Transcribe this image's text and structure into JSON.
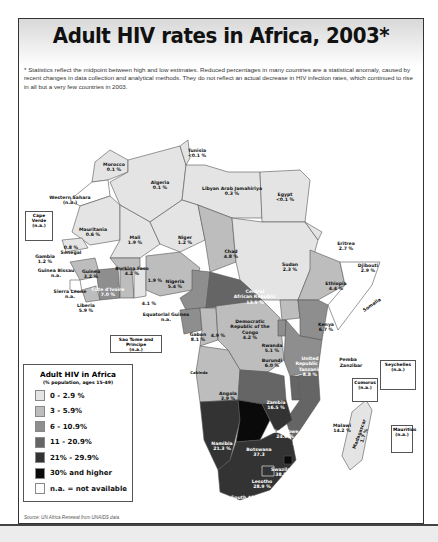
{
  "title": "Adult HIV rates in Africa, 2003*",
  "note": "* Statistics reflect the midpoint between high and low estimates. Reduced percentages in many countries are a statistical anomaly, caused by recent changes in data collection and analytical methods. They do not reflect an actual decrease in HIV infection rates, which continued to rise in all but a very few countries in 2003.",
  "legend": {
    "title": "Adult HIV in Africa",
    "subtitle": "(% population, ages 15-49)",
    "items": [
      {
        "label": "0 - 2.9 %",
        "color": "#e4e4e4"
      },
      {
        "label": "3 - 5.9%",
        "color": "#bdbdbd"
      },
      {
        "label": "6 - 10.9%",
        "color": "#8e8e8e"
      },
      {
        "label": "11 - 20.9%",
        "color": "#656565"
      },
      {
        "label": "21% - 29.9%",
        "color": "#333333"
      },
      {
        "label": "30% and higher",
        "color": "#0a0a0a"
      },
      {
        "label": "n.a. = not available",
        "color": "#ffffff"
      }
    ]
  },
  "source": "Source: UN Africa Renewal from UNAIDS data.",
  "countries": [
    {
      "name": "Tunisia",
      "value": "<0.1 %"
    },
    {
      "name": "Morocco",
      "value": "0.1 %"
    },
    {
      "name": "Algeria",
      "value": "0.1 %"
    },
    {
      "name": "Libyan Arab Jamahiriya",
      "value": "0.3 %"
    },
    {
      "name": "Egypt",
      "value": "<0.1 %"
    },
    {
      "name": "Western Sahara",
      "value": "(n.a.)"
    },
    {
      "name": "Mauritania",
      "value": "0.6 %"
    },
    {
      "name": "Mali",
      "value": "1.9 %"
    },
    {
      "name": "Niger",
      "value": "1.2 %"
    },
    {
      "name": "Chad",
      "value": "4.8 %"
    },
    {
      "name": "Sudan",
      "value": "2.3 %"
    },
    {
      "name": "Eritrea",
      "value": "2.7 %"
    },
    {
      "name": "Djibouti",
      "value": "2.9 %"
    },
    {
      "name": "Ethiopia",
      "value": "4.4 %"
    },
    {
      "name": "Somalia",
      "value": "n.a."
    },
    {
      "name": "Senegal",
      "value": "0.8 %"
    },
    {
      "name": "Gambia",
      "value": "1.2 %"
    },
    {
      "name": "Guinea Bissau",
      "value": "n.a."
    },
    {
      "name": "Guinea",
      "value": "3.2 %"
    },
    {
      "name": "Sierra Leone",
      "value": "n.a."
    },
    {
      "name": "Liberia",
      "value": "5.9 %"
    },
    {
      "name": "Côte d'Ivoire",
      "value": "7.0 %"
    },
    {
      "name": "Burkina Faso",
      "value": "4.2 %"
    },
    {
      "name": "Ghana",
      "value": "3.1 %"
    },
    {
      "name": "Togo",
      "value": "4.1 %"
    },
    {
      "name": "Benin",
      "value": "1.9 %"
    },
    {
      "name": "Nigeria",
      "value": "5.4 %"
    },
    {
      "name": "Cameroon",
      "value": "6.9 %"
    },
    {
      "name": "Central African Republic",
      "value": "13.5 %"
    },
    {
      "name": "Equatorial Guinea",
      "value": "n.a."
    },
    {
      "name": "Gabon",
      "value": "8.1 %"
    },
    {
      "name": "Congo",
      "value": "4.9 %"
    },
    {
      "name": "Democratic Republic of the Congo",
      "value": "4.2 %"
    },
    {
      "name": "Uganda",
      "value": "4.1 %"
    },
    {
      "name": "Kenya",
      "value": "6.7 %"
    },
    {
      "name": "Rwanda",
      "value": "5.1 %"
    },
    {
      "name": "Burundi",
      "value": "6.0 %"
    },
    {
      "name": "United Republic of Tanzania",
      "value": "8.8 %"
    },
    {
      "name": "Angola",
      "value": "3.9 %"
    },
    {
      "name": "Zambia",
      "value": "16.5 %"
    },
    {
      "name": "Malawi",
      "value": "14.2 %"
    },
    {
      "name": "Mozambique",
      "value": "12.2 %"
    },
    {
      "name": "Zimbabwe",
      "value": "24.6 %"
    },
    {
      "name": "Namibia",
      "value": "21.3 %"
    },
    {
      "name": "Botswana",
      "value": "37.3"
    },
    {
      "name": "Swaziland",
      "value": "38.8 %"
    },
    {
      "name": "Lesotho",
      "value": "28.9 %"
    },
    {
      "name": "South Africa",
      "value": "21.5 %"
    },
    {
      "name": "Madagascar",
      "value": "1.7 %"
    }
  ],
  "insets": {
    "cape_verde": {
      "name": "Cape Verde",
      "value": "(n.a.)"
    },
    "sao_tome": {
      "name": "Sao Tome and Principe",
      "value": "(n.a.)"
    },
    "seychelles": {
      "name": "Seychelles",
      "value": "(n.a.)"
    },
    "comoros": {
      "name": "Comoros",
      "value": "(n.a.)"
    },
    "mauritius": {
      "name": "Mauritius",
      "value": "(n.a.)"
    }
  },
  "places": {
    "cabinda": "Cabinda",
    "pemba": "Pemba",
    "zanzibar": "Zanzibar"
  }
}
